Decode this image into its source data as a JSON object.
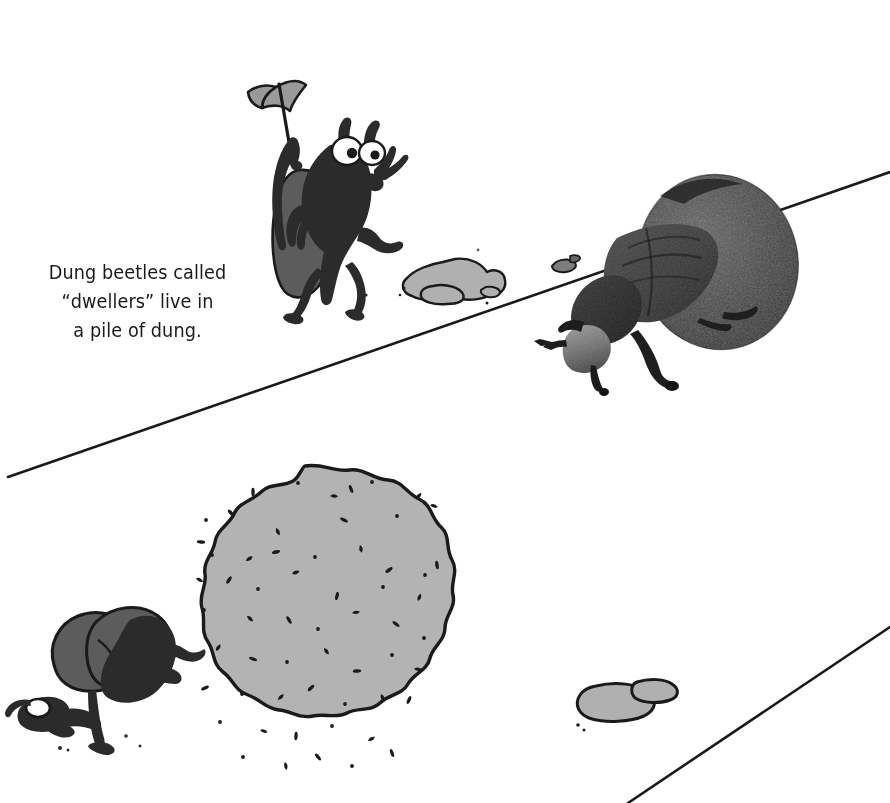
{
  "page": {
    "background_color": "#ffffff",
    "width": 890,
    "height": 803,
    "kind": "illustrated-book-page-spread"
  },
  "caption": {
    "text": "Dung beetles called\n“dwellers” live in\na pile of dung.",
    "lines": [
      "Dung beetles called",
      "“dwellers” live in",
      "a pile of dung."
    ],
    "color": "#1a1a1a",
    "align": "center"
  },
  "palette": {
    "ink": "#1a1a1a",
    "beetle_body": "#2b2b2b",
    "beetle_shell": "#5c5c5c",
    "rock_gray": "#b0b0b0",
    "dung_ball_gray": "#b3b3b3",
    "flag_gray": "#9a9a9a",
    "eye_white": "#ffffff",
    "photo_dark": "#2e2e2e",
    "photo_mid": "#4a4a4a",
    "photo_light": "#9d9d9d",
    "paper": "#ffffff"
  },
  "ground_lines": [
    {
      "name": "upper-ground-line",
      "x1": 8,
      "y1": 477,
      "x2": 890,
      "y2": 172,
      "stroke": "#1a1a1a",
      "width": 2.6
    },
    {
      "name": "lower-ground-line",
      "x1": 628,
      "y1": 803,
      "x2": 890,
      "y2": 627,
      "stroke": "#1a1a1a",
      "width": 2.6
    }
  ],
  "figures": [
    {
      "id": "cartoon-beetle-with-flag",
      "label": "Cartoon dung beetle waving a flag",
      "type": "illustration",
      "bbox": [
        240,
        78,
        400,
        300
      ],
      "holds": "flag"
    },
    {
      "id": "photo-dung-beetle",
      "label": "Photograph of a dung beetle pushing a dung ball",
      "type": "photograph",
      "bbox": [
        548,
        168,
        800,
        395
      ]
    },
    {
      "id": "big-dung-ball",
      "label": "Large gray speckled dung ball",
      "type": "illustration",
      "center": [
        305,
        625
      ],
      "radius": 155
    },
    {
      "id": "cartoon-beetle-pushing",
      "label": "Cartoon dung beetle pushing the large dung ball",
      "type": "illustration",
      "bbox": [
        8,
        612,
        200,
        752
      ]
    },
    {
      "id": "rock-cluster-top",
      "label": "Cluster of gray rocks near the center top",
      "type": "illustration",
      "bbox": [
        400,
        258,
        510,
        302
      ]
    },
    {
      "id": "rock-cluster-bottom",
      "label": "Cluster of gray rocks near the bottom right",
      "type": "illustration",
      "bbox": [
        575,
        680,
        680,
        722
      ]
    },
    {
      "id": "debris-specks",
      "label": "Small dark specks of dung debris",
      "type": "illustration"
    }
  ],
  "dung_ball": {
    "speckles": [
      [
        253,
        492
      ],
      [
        298,
        483
      ],
      [
        330,
        496
      ],
      [
        351,
        489
      ],
      [
        372,
        482
      ],
      [
        416,
        499
      ],
      [
        231,
        513
      ],
      [
        206,
        520
      ],
      [
        276,
        528
      ],
      [
        344,
        520
      ],
      [
        397,
        516
      ],
      [
        430,
        505
      ],
      [
        201,
        542
      ],
      [
        212,
        555
      ],
      [
        246,
        561
      ],
      [
        276,
        552
      ],
      [
        315,
        557
      ],
      [
        360,
        545
      ],
      [
        389,
        570
      ],
      [
        425,
        575
      ],
      [
        196,
        578
      ],
      [
        229,
        580
      ],
      [
        258,
        589
      ],
      [
        292,
        574
      ],
      [
        337,
        596
      ],
      [
        383,
        587
      ],
      [
        418,
        601
      ],
      [
        437,
        565
      ],
      [
        204,
        610
      ],
      [
        247,
        616
      ],
      [
        289,
        620
      ],
      [
        318,
        629
      ],
      [
        352,
        613
      ],
      [
        396,
        624
      ],
      [
        424,
        638
      ],
      [
        216,
        651
      ],
      [
        253,
        659
      ],
      [
        287,
        662
      ],
      [
        324,
        648
      ],
      [
        357,
        671
      ],
      [
        392,
        655
      ],
      [
        414,
        669
      ],
      [
        205,
        688
      ],
      [
        242,
        694
      ],
      [
        278,
        700
      ],
      [
        311,
        688
      ],
      [
        345,
        704
      ],
      [
        381,
        694
      ],
      [
        409,
        700
      ],
      [
        220,
        722
      ],
      [
        260,
        730
      ],
      [
        296,
        736
      ],
      [
        332,
        726
      ],
      [
        368,
        741
      ],
      [
        392,
        753
      ],
      [
        243,
        757
      ],
      [
        285,
        762
      ],
      [
        318,
        757
      ],
      [
        352,
        766
      ]
    ]
  }
}
